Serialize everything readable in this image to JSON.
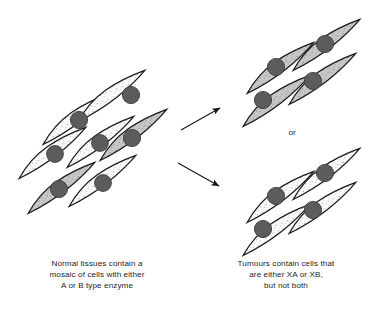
{
  "figure": {
    "or_label": "or",
    "caption_left": "Normal tissues contain a\nmosaic of cells with either\nA or B type enzyme",
    "caption_right": "Tumours contain cells that\nare either XA or XB,\nbut not both"
  },
  "colors": {
    "outline": "#1a1a1a",
    "cell_light_fill": "#fcfcfc",
    "cell_gray_fill": "#c9c9c9",
    "nucleus_fill": "#5c5c5c",
    "nucleus_stroke": "#3a3a3a",
    "stipple": "#6f6f6f",
    "arrow": "#141414",
    "background": "#ffffff",
    "text": "#1d1d1d"
  },
  "clusters": [
    {
      "id": "normal-tissue",
      "name": "normal-tissue-cluster",
      "description": "Mosaic of cells with either A or B type enzyme",
      "cell_count": 7,
      "cells": [
        {
          "id": "n1",
          "type": "A",
          "shade": "light",
          "cx": 108,
          "cy": 96,
          "nx": 111,
          "ny": 93
        },
        {
          "id": "n2",
          "type": "A",
          "shade": "light",
          "cx": 75,
          "cy": 120,
          "nx": 78,
          "ny": 120
        },
        {
          "id": "n3",
          "type": "A",
          "shade": "light",
          "cx": 100,
          "cy": 140,
          "nx": 99,
          "ny": 142
        },
        {
          "id": "n4",
          "type": "B",
          "shade": "gray",
          "cx": 133,
          "cy": 136,
          "nx": 131,
          "ny": 138
        },
        {
          "id": "n5",
          "type": "A",
          "shade": "light",
          "cx": 53,
          "cy": 153,
          "nx": 55,
          "ny": 154
        },
        {
          "id": "n6",
          "type": "B",
          "shade": "gray",
          "cx": 60,
          "cy": 188,
          "nx": 58,
          "ny": 189
        },
        {
          "id": "n7",
          "type": "A",
          "shade": "light",
          "cx": 100,
          "cy": 182,
          "nx": 101,
          "ny": 184
        }
      ]
    },
    {
      "id": "tumour-xa",
      "name": "tumour-xa-cluster",
      "description": "Tumour composed entirely of XA type cells",
      "cell_count": 4,
      "shade": "gray",
      "cells": [
        {
          "id": "a1",
          "type": "XA",
          "shade": "gray",
          "cx": 330,
          "cy": 45,
          "nx": 326,
          "ny": 45
        },
        {
          "id": "a2",
          "type": "XA",
          "shade": "gray",
          "cx": 287,
          "cy": 67,
          "nx": 277,
          "ny": 68
        },
        {
          "id": "a3",
          "type": "XA",
          "shade": "gray",
          "cx": 317,
          "cy": 82,
          "nx": 314,
          "ny": 83
        },
        {
          "id": "a4",
          "type": "XA",
          "shade": "gray",
          "cx": 272,
          "cy": 102,
          "nx": 264,
          "ny": 101
        }
      ]
    },
    {
      "id": "tumour-xb",
      "name": "tumour-xb-cluster",
      "description": "Tumour composed entirely of XB type cells",
      "cell_count": 4,
      "shade": "light",
      "cells": [
        {
          "id": "b1",
          "type": "XB",
          "shade": "light",
          "cx": 330,
          "cy": 173,
          "nx": 326,
          "ny": 174
        },
        {
          "id": "b2",
          "type": "XB",
          "shade": "light",
          "cx": 287,
          "cy": 196,
          "nx": 277,
          "ny": 196
        },
        {
          "id": "b3",
          "type": "XB",
          "shade": "light",
          "cx": 317,
          "cy": 211,
          "nx": 314,
          "ny": 211
        },
        {
          "id": "b4",
          "type": "XB",
          "shade": "light",
          "cx": 272,
          "cy": 231,
          "nx": 264,
          "ny": 230
        }
      ]
    }
  ],
  "arrows": [
    {
      "id": "arrow-to-xa",
      "name": "arrow-to-tumour-xa",
      "x1": 181,
      "y1": 130,
      "x2": 222,
      "y2": 107
    },
    {
      "id": "arrow-to-xb",
      "name": "arrow-to-tumour-xb",
      "x1": 178,
      "y1": 163,
      "x2": 221,
      "y2": 187
    }
  ]
}
